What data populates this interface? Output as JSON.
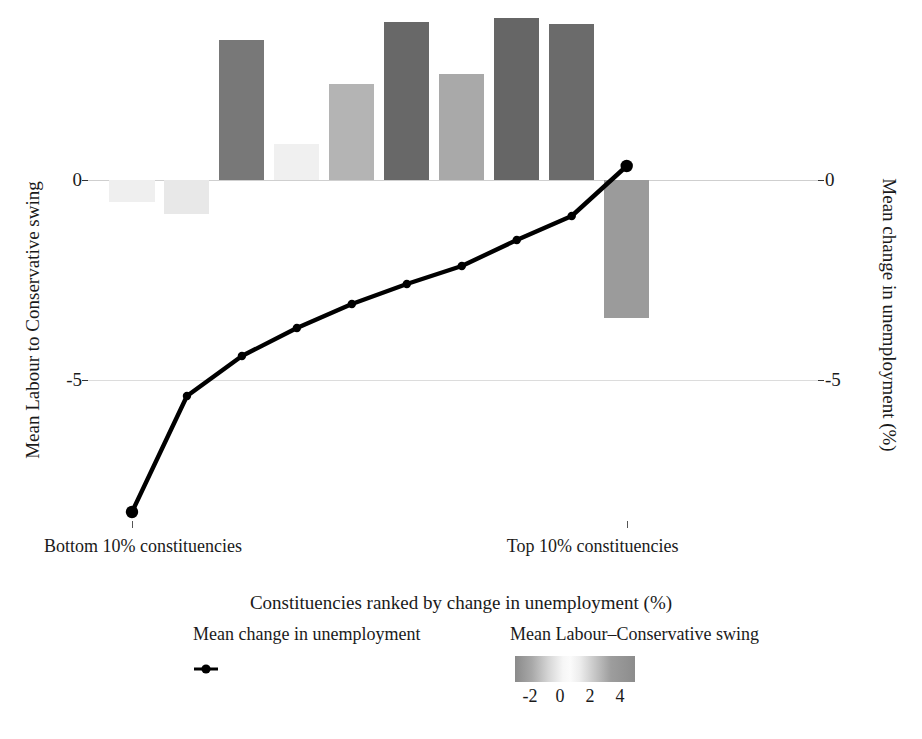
{
  "axes": {
    "y_left": {
      "title": "Mean Labour to Conservative swing",
      "ticks": [
        "0",
        "-5"
      ],
      "tick_values": [
        0,
        -5
      ]
    },
    "y_right": {
      "title": "Mean change in unemployment (%)",
      "ticks": [
        "0",
        "-5"
      ],
      "tick_values": [
        0,
        -5
      ]
    },
    "x": {
      "title": "Constituencies ranked by change in unemployment (%)",
      "tick_labels": [
        "Bottom 10% constituencies",
        "Top 10% constituencies"
      ]
    }
  },
  "legend": {
    "line_title": "Mean change in unemployment",
    "fill_title": "Mean Labour–Conservative swing",
    "colorbar_ticks": [
      "-2",
      "0",
      "2",
      "4"
    ],
    "colorbar_tick_values": [
      -2,
      0,
      2,
      4
    ],
    "colorbar_range": [
      -3,
      5
    ]
  },
  "colors": {
    "line": "#000000",
    "gridline": "#dcdcdc",
    "background": "#ffffff",
    "bar_low": "#8a8a8a",
    "bar_mid": "#fbfbfb",
    "bar_high": "#8c8c8c"
  },
  "chart_data": {
    "type": "bar",
    "title": "",
    "subtitle": "",
    "xlabel": "Constituencies ranked by change in unemployment (%)",
    "ylabel": "Mean Labour to Conservative swing",
    "ylabel_secondary": "Mean change in unemployment (%)",
    "grid": true,
    "legend_position": "bottom",
    "ylim": [
      -8.5,
      4.5
    ],
    "ylim_secondary": [
      -8.5,
      4.5
    ],
    "x": [
      1,
      2,
      3,
      4,
      5,
      6,
      7,
      8,
      9,
      10
    ],
    "categories": [
      "Bottom 10% constituencies",
      "decile 2",
      "decile 3",
      "decile 4",
      "decile 5",
      "decile 6",
      "decile 7",
      "decile 8",
      "decile 9",
      "Top 10% constituencies"
    ],
    "series": [
      {
        "name": "Mean Labour–Conservative swing",
        "type": "bar",
        "axis": "left",
        "values": [
          -0.55,
          -0.85,
          3.5,
          0.9,
          2.4,
          3.95,
          2.65,
          4.05,
          3.9,
          -3.45
        ],
        "fill_encoding": "value",
        "fill_colors": [
          "#efefef",
          "#e8e8e8",
          "#787878",
          "#f0f0f0",
          "#b4b4b4",
          "#686868",
          "#a9a9a9",
          "#666666",
          "#6b6b6b",
          "#9b9b9b"
        ]
      },
      {
        "name": "Mean change in unemployment",
        "type": "line",
        "axis": "right",
        "marker": "point",
        "values": [
          -8.3,
          -5.4,
          -4.4,
          -3.7,
          -3.1,
          -2.6,
          -2.15,
          -1.5,
          -0.9,
          0.35
        ]
      }
    ]
  }
}
